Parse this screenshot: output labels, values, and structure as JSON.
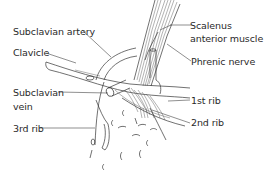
{
  "figure": {
    "type": "anatomical line drawing"
  },
  "labels": {
    "subclavian_artery": "Subclavian artery",
    "clavicle": "Clavicle",
    "subclavian_vein_line1": "Subclavian",
    "subclavian_vein_line2": "vein",
    "third_rib": "3rd rib",
    "scalenus_line1": "Scalenus",
    "scalenus_line2": "anterior muscle",
    "phrenic_nerve": "Phrenic nerve",
    "first_rib": "1st rib",
    "second_rib": "2nd rib"
  },
  "colors": {
    "line": "#333333",
    "text": "#2a2a2a",
    "background": "#ffffff"
  }
}
